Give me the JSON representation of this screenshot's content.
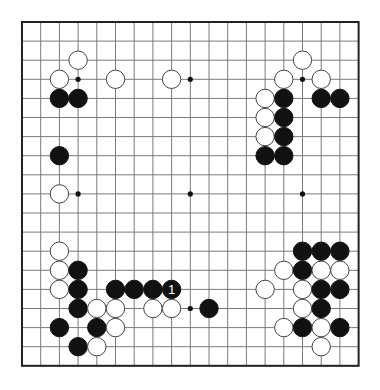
{
  "board": {
    "size": 19,
    "origin_x": 22,
    "origin_y": 22,
    "spacing_x": 18.7,
    "spacing_y": 19.1,
    "stone_radius": 9.2,
    "colors": {
      "black": "#111111",
      "white": "#ffffff",
      "line": "#7a7a7a",
      "border": "#222222"
    },
    "hoshi": [
      [
        3,
        3
      ],
      [
        9,
        3
      ],
      [
        15,
        3
      ],
      [
        3,
        9
      ],
      [
        9,
        9
      ],
      [
        15,
        9
      ],
      [
        3,
        15
      ],
      [
        9,
        15
      ],
      [
        15,
        15
      ]
    ],
    "stones": [
      {
        "color": "white",
        "col": 3,
        "row": 2
      },
      {
        "color": "white",
        "col": 2,
        "row": 3
      },
      {
        "color": "white",
        "col": 5,
        "row": 3
      },
      {
        "color": "white",
        "col": 8,
        "row": 3
      },
      {
        "color": "black",
        "col": 2,
        "row": 4
      },
      {
        "color": "black",
        "col": 3,
        "row": 4
      },
      {
        "color": "black",
        "col": 2,
        "row": 7
      },
      {
        "color": "white",
        "col": 2,
        "row": 9
      },
      {
        "color": "white",
        "col": 15,
        "row": 2
      },
      {
        "color": "white",
        "col": 14,
        "row": 3
      },
      {
        "color": "white",
        "col": 16,
        "row": 3
      },
      {
        "color": "white",
        "col": 13,
        "row": 4
      },
      {
        "color": "black",
        "col": 14,
        "row": 4
      },
      {
        "color": "black",
        "col": 16,
        "row": 4
      },
      {
        "color": "black",
        "col": 17,
        "row": 4
      },
      {
        "color": "white",
        "col": 13,
        "row": 5
      },
      {
        "color": "black",
        "col": 14,
        "row": 5
      },
      {
        "color": "white",
        "col": 13,
        "row": 6
      },
      {
        "color": "black",
        "col": 14,
        "row": 6
      },
      {
        "color": "black",
        "col": 13,
        "row": 7
      },
      {
        "color": "black",
        "col": 14,
        "row": 7
      },
      {
        "color": "white",
        "col": 2,
        "row": 12
      },
      {
        "color": "white",
        "col": 2,
        "row": 13
      },
      {
        "color": "black",
        "col": 3,
        "row": 13
      },
      {
        "color": "white",
        "col": 2,
        "row": 14
      },
      {
        "color": "black",
        "col": 3,
        "row": 14
      },
      {
        "color": "black",
        "col": 5,
        "row": 14
      },
      {
        "color": "black",
        "col": 6,
        "row": 14
      },
      {
        "color": "black",
        "col": 7,
        "row": 14
      },
      {
        "color": "black",
        "col": 8,
        "row": 14,
        "label": "1"
      },
      {
        "color": "black",
        "col": 3,
        "row": 15
      },
      {
        "color": "white",
        "col": 4,
        "row": 15
      },
      {
        "color": "white",
        "col": 5,
        "row": 15
      },
      {
        "color": "white",
        "col": 7,
        "row": 15
      },
      {
        "color": "white",
        "col": 8,
        "row": 15
      },
      {
        "color": "black",
        "col": 10,
        "row": 15
      },
      {
        "color": "black",
        "col": 2,
        "row": 16
      },
      {
        "color": "black",
        "col": 4,
        "row": 16
      },
      {
        "color": "white",
        "col": 5,
        "row": 16
      },
      {
        "color": "black",
        "col": 3,
        "row": 17
      },
      {
        "color": "white",
        "col": 4,
        "row": 17
      },
      {
        "color": "black",
        "col": 15,
        "row": 12
      },
      {
        "color": "black",
        "col": 16,
        "row": 12
      },
      {
        "color": "black",
        "col": 17,
        "row": 12
      },
      {
        "color": "white",
        "col": 14,
        "row": 13
      },
      {
        "color": "black",
        "col": 15,
        "row": 13
      },
      {
        "color": "white",
        "col": 16,
        "row": 13
      },
      {
        "color": "white",
        "col": 17,
        "row": 13
      },
      {
        "color": "white",
        "col": 13,
        "row": 14
      },
      {
        "color": "white",
        "col": 15,
        "row": 14
      },
      {
        "color": "black",
        "col": 16,
        "row": 14
      },
      {
        "color": "black",
        "col": 17,
        "row": 14
      },
      {
        "color": "white",
        "col": 15,
        "row": 15
      },
      {
        "color": "black",
        "col": 16,
        "row": 15
      },
      {
        "color": "white",
        "col": 14,
        "row": 16
      },
      {
        "color": "black",
        "col": 15,
        "row": 16
      },
      {
        "color": "white",
        "col": 16,
        "row": 16
      },
      {
        "color": "black",
        "col": 17,
        "row": 16
      },
      {
        "color": "white",
        "col": 16,
        "row": 17
      }
    ]
  }
}
